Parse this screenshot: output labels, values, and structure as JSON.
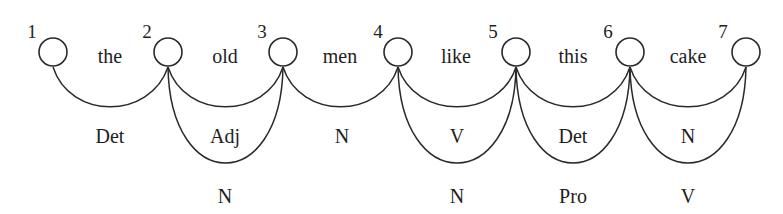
{
  "diagram": {
    "line_color": "#2a2a2a",
    "text_color": "#1e1e1e",
    "nodes": [
      {
        "id": "1",
        "x": 53,
        "y": 52
      },
      {
        "id": "2",
        "x": 168,
        "y": 52
      },
      {
        "id": "3",
        "x": 283,
        "y": 52
      },
      {
        "id": "4",
        "x": 398,
        "y": 52
      },
      {
        "id": "5",
        "x": 516,
        "y": 52
      },
      {
        "id": "6",
        "x": 630,
        "y": 52
      },
      {
        "id": "7",
        "x": 746,
        "y": 52
      }
    ],
    "words": [
      "the",
      "old",
      "men",
      "like",
      "this",
      "cake"
    ],
    "edges": [
      {
        "from": "1",
        "to": "2",
        "word": "the",
        "tags": [
          "Det"
        ]
      },
      {
        "from": "2",
        "to": "3",
        "word": "old",
        "tags": [
          "Adj",
          "N"
        ]
      },
      {
        "from": "3",
        "to": "4",
        "word": "men",
        "tags": [
          "N"
        ]
      },
      {
        "from": "4",
        "to": "5",
        "word": "like",
        "tags": [
          "V",
          "N"
        ]
      },
      {
        "from": "5",
        "to": "6",
        "word": "this",
        "tags": [
          "Det",
          "Pro"
        ]
      },
      {
        "from": "6",
        "to": "7",
        "word": "cake",
        "tags": [
          "N",
          "V"
        ]
      }
    ]
  }
}
